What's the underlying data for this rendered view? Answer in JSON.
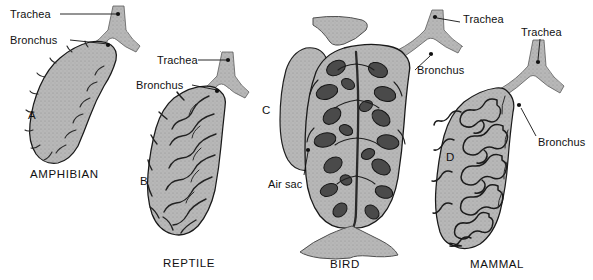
{
  "figure": {
    "background_color": "#ffffff",
    "ink_color": "#111111",
    "tissue_fill": "#b4b4b4",
    "tissue_dark": "#4a4a4a",
    "tissue_mid": "#8d8d8d",
    "outline_color": "#1a1a1a"
  },
  "panels": [
    {
      "id": "amphibian",
      "letter": "A",
      "caption": "AMPHIBIAN",
      "letter_pos": {
        "x": 28,
        "y": 110
      },
      "caption_pos": {
        "x": 30,
        "y": 168
      },
      "labels": [
        {
          "name": "trachea",
          "text": "Trachea",
          "x": 10,
          "y": 9
        },
        {
          "name": "bronchus",
          "text": "Bronchus",
          "x": 10,
          "y": 35
        }
      ]
    },
    {
      "id": "reptile",
      "letter": "B",
      "caption": "REPTILE",
      "letter_pos": {
        "x": 140,
        "y": 176
      },
      "caption_pos": {
        "x": 163,
        "y": 257
      },
      "labels": [
        {
          "name": "trachea",
          "text": "Trachea",
          "x": 157,
          "y": 55
        },
        {
          "name": "bronchus",
          "text": "Bronchus",
          "x": 136,
          "y": 80
        }
      ]
    },
    {
      "id": "bird",
      "letter": "C",
      "caption": "BIRD",
      "letter_pos": {
        "x": 262,
        "y": 105
      },
      "caption_pos": {
        "x": 330,
        "y": 258
      },
      "labels": [
        {
          "name": "trachea",
          "text": "Trachea",
          "x": 463,
          "y": 14
        },
        {
          "name": "bronchus",
          "text": "Bronchus",
          "x": 417,
          "y": 65
        },
        {
          "name": "air-sac",
          "text": "Air sac",
          "x": 268,
          "y": 179
        }
      ]
    },
    {
      "id": "mammal",
      "letter": "D",
      "caption": "MAMMAL",
      "letter_pos": {
        "x": 446,
        "y": 152
      },
      "caption_pos": {
        "x": 470,
        "y": 258
      },
      "labels": [
        {
          "name": "trachea",
          "text": "Trachea",
          "x": 521,
          "y": 27
        },
        {
          "name": "bronchus",
          "text": "Bronchus",
          "x": 538,
          "y": 137
        }
      ]
    }
  ]
}
